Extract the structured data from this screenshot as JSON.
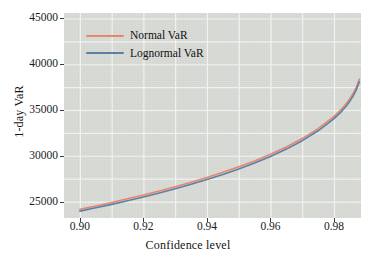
{
  "chart_data": {
    "type": "line",
    "title": "",
    "xlabel": "Confidence level",
    "ylabel": "1-day VaR",
    "xlim": [
      0.895,
      0.9885
    ],
    "ylim": [
      23200,
      45600
    ],
    "xticks": [
      "0.90",
      "0.92",
      "0.94",
      "0.96",
      "0.98"
    ],
    "xtick_values": [
      0.9,
      0.92,
      0.94,
      0.96,
      0.98
    ],
    "yticks": [
      "25000",
      "30000",
      "35000",
      "40000",
      "45000"
    ],
    "ytick_values": [
      25000,
      30000,
      35000,
      40000,
      45000
    ],
    "grid": true,
    "grid_color": "#f2f2f0",
    "plot_background": "#d8dad5",
    "legend_position": "upper center",
    "x": [
      0.9,
      0.905,
      0.91,
      0.915,
      0.92,
      0.925,
      0.93,
      0.935,
      0.94,
      0.945,
      0.95,
      0.955,
      0.96,
      0.965,
      0.97,
      0.975,
      0.98,
      0.982,
      0.984,
      0.985,
      0.986,
      0.987,
      0.988
    ],
    "series": [
      {
        "name": "Normal VaR",
        "color": "#e4876c",
        "values": [
          24150,
          24520,
          24900,
          25300,
          25720,
          26160,
          26620,
          27110,
          27630,
          28190,
          28790,
          29440,
          30160,
          30960,
          31880,
          32960,
          34300,
          34960,
          35760,
          36240,
          36800,
          37480,
          38380
        ]
      },
      {
        "name": "Lognormal VaR",
        "color": "#5d7fa6",
        "values": [
          23950,
          24310,
          24690,
          25080,
          25490,
          25930,
          26390,
          26880,
          27400,
          27960,
          28560,
          29210,
          29930,
          30730,
          31650,
          32730,
          34060,
          34710,
          35500,
          35970,
          36520,
          37190,
          38080
        ]
      }
    ],
    "legend": [
      {
        "label": "Normal VaR",
        "color": "#e4876c"
      },
      {
        "label": "Lognormal VaR",
        "color": "#5d7fa6"
      }
    ]
  }
}
